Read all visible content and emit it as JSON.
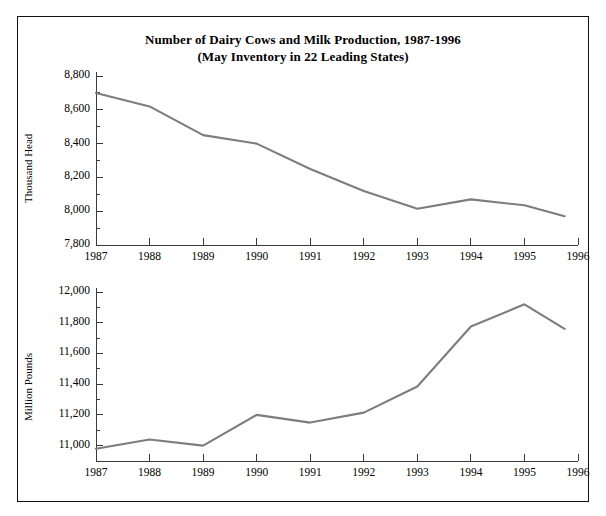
{
  "title": {
    "line1": "Number of Dairy Cows and Milk Production, 1987-1996",
    "line2": "(May Inventory in 22 Leading States)"
  },
  "style": {
    "line_color": "#7d7d7d",
    "axis_color": "#3a3a3a",
    "frame_color": "#111111",
    "background": "#ffffff"
  },
  "chart_data": [
    {
      "type": "line",
      "title": "Number of Dairy Cows and Milk Production, 1987-1996",
      "subtitle": "(May Inventory in 22 Leading States)",
      "xlabel": "",
      "ylabel": "Thousand Head",
      "xlim": [
        1987,
        1996
      ],
      "ylim": [
        7800,
        8800
      ],
      "grid": false,
      "legend": "none",
      "x": [
        1987,
        1988,
        1989,
        1990,
        1991,
        1992,
        1993,
        1994,
        1995,
        1995.75
      ],
      "values": [
        8700,
        8620,
        8450,
        8400,
        8250,
        8120,
        8015,
        8070,
        8035,
        7970
      ],
      "xticks": [
        "1987",
        "1988",
        "1989",
        "1990",
        "1991",
        "1992",
        "1993",
        "1994",
        "1995",
        "1996"
      ],
      "yticks": [
        "7,800",
        "8,000",
        "8,200",
        "8,400",
        "8,600",
        "8,800"
      ],
      "ytick_values": [
        7800,
        8000,
        8200,
        8400,
        8600,
        8800
      ],
      "minor_tick_step": 100
    },
    {
      "type": "line",
      "title": "",
      "xlabel": "",
      "ylabel": "Million Pounds",
      "xlim": [
        1987,
        1996
      ],
      "ylim": [
        10900,
        12000
      ],
      "grid": false,
      "legend": "none",
      "x": [
        1987,
        1988,
        1989,
        1990,
        1991,
        1992,
        1993,
        1994,
        1995,
        1995.75
      ],
      "values": [
        10980,
        11040,
        11000,
        11200,
        11150,
        11215,
        11385,
        11775,
        11920,
        11760
      ],
      "xticks": [
        "1987",
        "1988",
        "1989",
        "1990",
        "1991",
        "1992",
        "1993",
        "1994",
        "1995",
        "1996"
      ],
      "yticks": [
        "11,000",
        "11,200",
        "11,400",
        "11,600",
        "11,800",
        "12,000"
      ],
      "ytick_values": [
        11000,
        11200,
        11400,
        11600,
        11800,
        12000
      ],
      "minor_tick_step": 100
    }
  ]
}
